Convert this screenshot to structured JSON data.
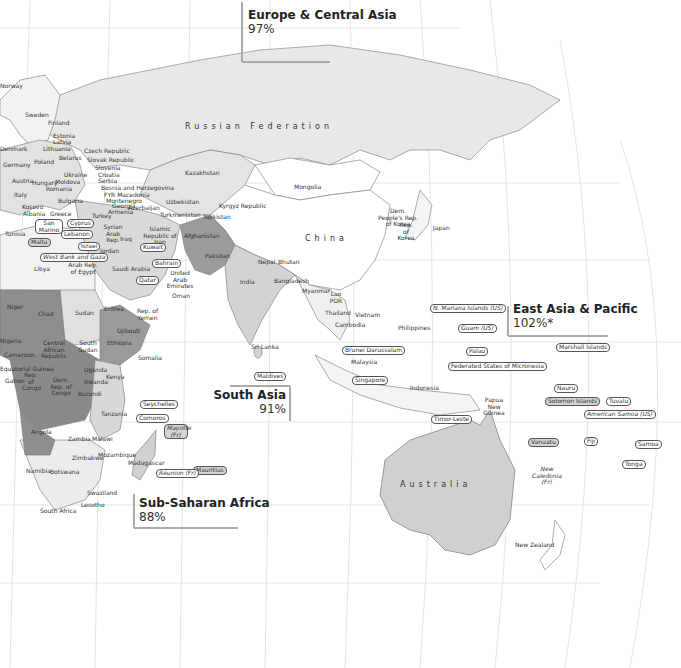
{
  "map": {
    "type": "world choropleth (Eastern Hemisphere)",
    "legend_colors": {
      "water": "#ffffff",
      "no_data": "#ffffff",
      "light": "#e6e6e6",
      "medium_light": "#cfcfcf",
      "medium": "#b4b4b4",
      "dark": "#8e8e8e",
      "graticule": "#dcdcdc",
      "border": "#6e6e6e"
    }
  },
  "regions": [
    {
      "name": "Europe & Central Asia",
      "value": "97%"
    },
    {
      "name": "East Asia & Pacific",
      "value": "102%*"
    },
    {
      "name": "South Asia",
      "value": "91%"
    },
    {
      "name": "Sub-Saharan Africa",
      "value": "88%"
    }
  ],
  "large_labels": {
    "russia": "Russian Federation",
    "china": "China",
    "australia": "Australia"
  },
  "labels": {
    "norway": "Norway",
    "sweden": "Sweden",
    "finland": "Finland",
    "estonia": "Estonia",
    "latvia": "Latvia",
    "lithuania": "Lithuania",
    "denmark": "Denmark",
    "poland": "Poland",
    "belarus": "Belarus",
    "germany": "Germany",
    "kingdom": "Kingdom",
    "czech": "Czech Republic",
    "slovak": "Slovak Republic",
    "slovenia": "Slovenia",
    "croatia": "Croatia",
    "serbia": "Serbia",
    "bosnia": "Bosnia and Herzegovina",
    "fyr": "FYR Macedonia",
    "montenegro": "Montenegro",
    "austria": "Austria",
    "hungary": "Hungary",
    "ukraine": "Ukraine",
    "moldova": "Moldova",
    "romania": "Romania",
    "switzerland": "Switzerland",
    "italy": "Italy",
    "bulgaria": "Bulgaria",
    "kosovo": "Kosovo",
    "albania": "Albania",
    "greece": "Greece",
    "turkey": "Turkey",
    "georgia": "Georgia",
    "armenia": "Armenia",
    "azerbaijan": "Azerbaijan",
    "kazakhstan": "Kazakhstan",
    "uzbekistan": "Uzbekistan",
    "turkmenistan": "Turkmenistan",
    "kyrgyz": "Kyrgyz Republic",
    "tajikistan": "Tajikistan",
    "mongolia": "Mongolia",
    "san_marino": "San Marino",
    "tunisia": "Tunisia",
    "malta": "Malta",
    "cyprus": "Cyprus",
    "lebanon": "Lebanon",
    "syria": "Syrian Arab Rep.",
    "iraq": "Iraq",
    "iran": "Islamic Republic of Iran",
    "israel": "Israel",
    "jordan": "Jordan",
    "kuwait": "Kuwait",
    "west_bank": "West Bank and Gaza",
    "bahrain": "Bahrain",
    "qatar": "Qatar",
    "uae": "United Arab Emirates",
    "oman": "Oman",
    "libya": "Libya",
    "egypt": "Arab Rep. of Egypt",
    "saudi": "Saudi Arabia",
    "afghanistan": "Afghanistan",
    "pakistan": "Pakistan",
    "nepal": "Nepal",
    "bhutan": "Bhutan",
    "india": "India",
    "bangladesh": "Bangladesh",
    "myanmar": "Myanmar",
    "lao": "Lao PDR",
    "thailand": "Thailand",
    "vietnam": "Vietnam",
    "cambodia": "Cambodia",
    "philippines": "Philippines",
    "dprk": "Dem. People's Rep. of Korea",
    "korea": "Rep. of Korea",
    "japan": "Japan",
    "sri_lanka": "Sri Lanka",
    "maldives": "Maldives",
    "brunei": "Brunei Darussalam",
    "malaysia": "Malaysia",
    "singapore": "Singapore",
    "indonesia": "Indonesia",
    "png": "Papua New Guinea",
    "timor": "Timor-Leste",
    "n_mariana": "N. Mariana Islands (US)",
    "guam": "Guam (US)",
    "palau": "Palau",
    "micronesia": "Federated States of Micronesia",
    "marshall": "Marshall Islands",
    "nauru": "Nauru",
    "solomon": "Solomon Islands",
    "tuvalu": "Tuvalu",
    "am_samoa": "American Samoa (US)",
    "vanuatu": "Vanuatu",
    "fiji": "Fiji",
    "samoa": "Samoa",
    "tonga": "Tonga",
    "new_caledonia": "New Caledonia (Fr)",
    "new_zealand": "New Zealand",
    "niger": "Niger",
    "chad": "Chad",
    "sudan": "Sudan",
    "eritrea": "Eritrea",
    "yemen": "Rep. of Yemen",
    "djibouti": "Djibouti",
    "nigeria": "Nigeria",
    "car": "Central African Republic",
    "south_sudan": "South Sudan",
    "ethiopia": "Ethiopia",
    "somalia": "Somalia",
    "cameroon": "Cameroon",
    "eq_guinea": "Equatorial Guinea",
    "gabon": "Gabon",
    "congo": "Rep. of Congo",
    "drc": "Dem. Rep. of Congo",
    "uganda": "Uganda",
    "kenya": "Kenya",
    "rwanda": "Rwanda",
    "burundi": "Burundi",
    "tanzania": "Tanzania",
    "seychelles": "Seychelles",
    "comoros": "Comoros",
    "mayotte": "Mayotte (Fr)",
    "angola": "Angola",
    "zambia": "Zambia",
    "malawi": "Malawi",
    "zimbabwe": "Zimbabwe",
    "mozambique": "Mozambique",
    "madagascar": "Madagascar",
    "namibia": "Namibia",
    "botswana": "Botswana",
    "mauritius": "Mauritius",
    "reunion": "Réunion (Fr)",
    "swaziland": "Swaziland",
    "lesotho": "Lesotho",
    "south_africa": "South Africa"
  }
}
